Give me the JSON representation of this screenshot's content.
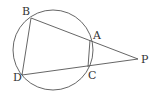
{
  "diagram": {
    "type": "geometry",
    "circle": {
      "cx": 53,
      "cy": 50,
      "r": 40
    },
    "points": {
      "A": {
        "x": 90,
        "y": 40,
        "label": "A",
        "lx": 93,
        "ly": 39
      },
      "B": {
        "x": 31,
        "y": 18,
        "label": "B",
        "lx": 22,
        "ly": 15
      },
      "C": {
        "x": 88,
        "y": 67,
        "label": "C",
        "lx": 88,
        "ly": 79
      },
      "D": {
        "x": 22,
        "y": 75,
        "label": "D",
        "lx": 13,
        "ly": 81
      },
      "P": {
        "x": 138,
        "y": 59,
        "label": "P",
        "lx": 141,
        "ly": 63
      }
    },
    "segments": [
      "BP",
      "DP",
      "BD",
      "AC"
    ],
    "stroke_color": "#555555"
  }
}
